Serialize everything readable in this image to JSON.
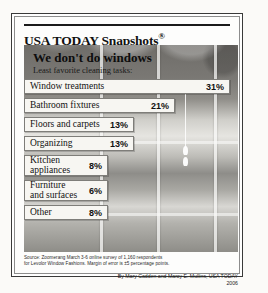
{
  "masthead": {
    "title": "USA TODAY Snapshots",
    "registered_mark": "®"
  },
  "headline": {
    "title": "We don't do windows",
    "subtitle": "Least favorite cleaning tasks:"
  },
  "source": {
    "line1": "Source: Zoomerang March 3-6 online survey of 1,160 respondents",
    "line2": "for Levolor Window Fashions. Margin of error is ±5 percentage points."
  },
  "byline": {
    "authors": "By Mary Cadden and Marcy E. Mullins, USA TODAY",
    "year": "2006"
  },
  "colors": {
    "frame": "#3a3a3a",
    "bar_fill": "#f7f6f2",
    "bar_border": "#7e7d79",
    "text": "#111111",
    "photo_dark": "#6f6d69",
    "photo_light": "#e6e5e1"
  },
  "chart_data": {
    "type": "bar",
    "orientation": "horizontal",
    "title": "We don't do windows",
    "subtitle": "Least favorite cleaning tasks:",
    "xlabel": "",
    "ylabel": "",
    "unit": "%",
    "xlim": [
      0,
      34
    ],
    "grid": false,
    "legend": false,
    "categories": [
      "Window treatments",
      "Bathroom fixtures",
      "Floors and carpets",
      "Organizing",
      "Kitchen appliances",
      "Furniture and surfaces",
      "Other"
    ],
    "values": [
      31,
      21,
      13,
      13,
      8,
      6,
      8
    ],
    "labels": [
      "31%",
      "21%",
      "13%",
      "13%",
      "8%",
      "6%",
      "8%"
    ],
    "items": [
      {
        "category": "Window treatments",
        "label_line1": "Window treatments",
        "label_line2": "",
        "value": 31,
        "value_label": "31%",
        "bar_px": 206
      },
      {
        "category": "Bathroom fixtures",
        "label_line1": "Bathroom fixtures",
        "label_line2": "",
        "value": 21,
        "value_label": "21%",
        "bar_px": 151
      },
      {
        "category": "Floors and carpets",
        "label_line1": "Floors and carpets",
        "label_line2": "",
        "value": 13,
        "value_label": "13%",
        "bar_px": 110
      },
      {
        "category": "Organizing",
        "label_line1": "Organizing",
        "label_line2": "",
        "value": 13,
        "value_label": "13%",
        "bar_px": 110
      },
      {
        "category": "Kitchen appliances",
        "label_line1": "Kitchen",
        "label_line2": "appliances",
        "value": 8,
        "value_label": "8%",
        "bar_px": 84
      },
      {
        "category": "Furniture and surfaces",
        "label_line1": "Furniture",
        "label_line2": "and surfaces",
        "value": 6,
        "value_label": "6%",
        "bar_px": 84
      },
      {
        "category": "Other",
        "label_line1": "Other",
        "label_line2": "",
        "value": 8,
        "value_label": "8%",
        "bar_px": 84
      }
    ],
    "source": "Source: Zoomerang March 3-6 online survey of 1,160 respondents for Levolor Window Fashions. Margin of error is ±5 percentage points."
  }
}
